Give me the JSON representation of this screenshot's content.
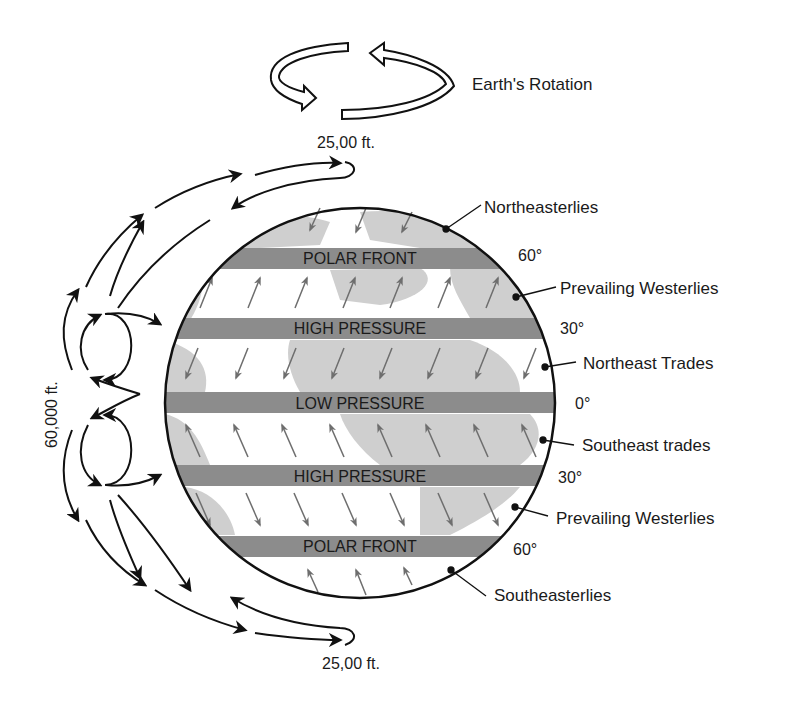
{
  "rotation": {
    "label": "Earth's Rotation"
  },
  "altitudes": {
    "top": "25,00 ft.",
    "bottom": "25,00 ft.",
    "side": "60,000 ft."
  },
  "bands": [
    {
      "label": "POLAR FRONT",
      "latitude": "60°"
    },
    {
      "label": "HIGH PRESSURE",
      "latitude": "30°"
    },
    {
      "label": "LOW PRESSURE",
      "latitude": "0°"
    },
    {
      "label": "HIGH PRESSURE",
      "latitude": "30°"
    },
    {
      "label": "POLAR FRONT",
      "latitude": "60°"
    }
  ],
  "winds": [
    {
      "label": "Northeasterlies"
    },
    {
      "label": "Prevailing Westerlies"
    },
    {
      "label": "Northeast Trades"
    },
    {
      "label": "Southeast trades"
    },
    {
      "label": "Prevailing Westerlies"
    },
    {
      "label": "Southeasterlies"
    }
  ],
  "colors": {
    "band": "#8c8c8c",
    "land": "#cfcfcf",
    "ocean": "#ffffff",
    "arrow": "#6e6e6e",
    "line": "#111111"
  }
}
